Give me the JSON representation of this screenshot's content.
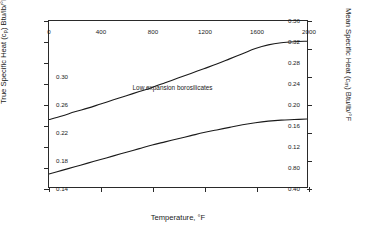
{
  "chart_data": {
    "type": "line",
    "title": "",
    "xlabel": "Temperature, °F",
    "ylabel": "True Specific Heat (cₒ) Btu/lb/°F",
    "ylabel_right": "Mean Specific Heat (cₘ) Btu/lb/°F",
    "xlim": [
      0,
      2000
    ],
    "ylim": [
      0.04,
      0.36
    ],
    "ylim_right": [
      0.14,
      0.38
    ],
    "grid": false,
    "legend": "none",
    "annotations": [
      {
        "text": "Low expansion borosilicates",
        "x": 950,
        "y": 0.232
      }
    ],
    "xticks": [
      0,
      400,
      800,
      1200,
      1600,
      2000
    ],
    "xticklabels": [
      "0",
      "400",
      "800",
      "1200",
      "1600",
      "2000"
    ],
    "yticks": [
      0.04,
      0.08,
      0.12,
      0.16,
      0.2,
      0.24,
      0.28,
      0.32,
      0.36
    ],
    "yticklabels": [
      "0.40",
      "0.80",
      "0.12",
      "0.16",
      "0.20",
      "0.24",
      "0.28",
      "0.32",
      "0.36"
    ],
    "yticks_right": [
      0.14,
      0.18,
      0.22,
      0.26,
      0.3,
      0.34,
      0.38
    ],
    "yticklabels_right": [
      "0.14",
      "0.18",
      "0.22",
      "0.26",
      "0.30",
      "",
      ""
    ],
    "series": [
      {
        "name": "True specific heat",
        "axis": "left",
        "color": "#1a1a1a",
        "x": [
          0,
          100,
          200,
          300,
          400,
          500,
          600,
          700,
          800,
          900,
          1000,
          1100,
          1200,
          1300,
          1400,
          1500,
          1600,
          1700,
          1800,
          1900,
          2000
        ],
        "y": [
          0.17,
          0.177,
          0.185,
          0.192,
          0.2,
          0.208,
          0.216,
          0.224,
          0.232,
          0.241,
          0.25,
          0.259,
          0.268,
          0.277,
          0.287,
          0.297,
          0.307,
          0.314,
          0.318,
          0.32,
          0.321
        ]
      },
      {
        "name": "Mean specific heat",
        "axis": "left",
        "color": "#1a1a1a",
        "x": [
          0,
          100,
          200,
          300,
          400,
          500,
          600,
          700,
          800,
          900,
          1000,
          1100,
          1200,
          1300,
          1400,
          1500,
          1600,
          1700,
          1800,
          1900,
          2000
        ],
        "y": [
          0.065,
          0.072,
          0.079,
          0.086,
          0.093,
          0.1,
          0.107,
          0.114,
          0.121,
          0.127,
          0.133,
          0.139,
          0.145,
          0.15,
          0.155,
          0.16,
          0.164,
          0.167,
          0.169,
          0.17,
          0.171
        ]
      }
    ]
  }
}
